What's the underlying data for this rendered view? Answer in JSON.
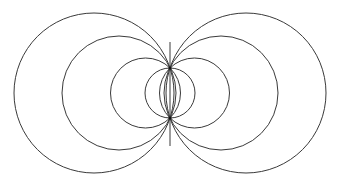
{
  "diagram": {
    "title": "",
    "width": 341,
    "height": 184,
    "background": "#ffffff",
    "stroke_color": "#3a3a3a",
    "stroke_width": 1,
    "foci": [
      {
        "x": 170,
        "y": 68
      },
      {
        "x": 170,
        "y": 118
      }
    ],
    "axis_line": {
      "x": 170,
      "y1": 42,
      "y2": 146
    },
    "circles": [
      {
        "id": "left-outer",
        "cx": 94,
        "cy": 93,
        "r": 80
      },
      {
        "id": "left-middle",
        "cx": 119,
        "cy": 93,
        "r": 57
      },
      {
        "id": "left-inner",
        "cx": 145.5,
        "cy": 93,
        "r": 35
      },
      {
        "id": "center",
        "cx": 170,
        "cy": 93,
        "r": 25
      },
      {
        "id": "right-inner",
        "cx": 194.5,
        "cy": 93,
        "r": 35
      },
      {
        "id": "right-middle",
        "cx": 221,
        "cy": 93,
        "r": 57
      },
      {
        "id": "right-outer",
        "cx": 246,
        "cy": 93,
        "r": 80
      }
    ]
  }
}
